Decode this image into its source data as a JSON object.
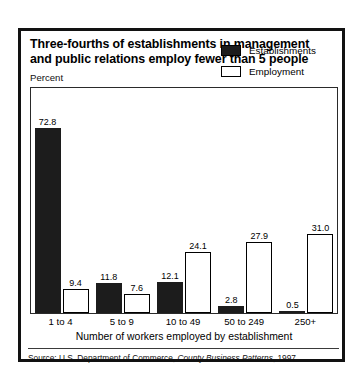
{
  "figure": {
    "title_line1": "Three-fourths of establishments in management",
    "title_line2": "and public relations employ fewer than 5 people",
    "percent_label": "Percent",
    "source_prefix": "Source: U.S. Department of Commerce, ",
    "source_italic": "County Business Patterns",
    "source_suffix": ", 1997"
  },
  "legend": {
    "items": [
      {
        "label": "Establishments",
        "swatch": "filled",
        "color": "#1c1c1c"
      },
      {
        "label": "Employment",
        "swatch": "open",
        "color": "#ffffff"
      }
    ]
  },
  "chart_data": {
    "type": "bar",
    "title": "Three-fourths of establishments in management and public relations employ fewer than 5 people",
    "xlabel": "Number of workers employed by establishment",
    "ylabel": "Percent",
    "ylim": [
      0,
      80
    ],
    "grid": false,
    "legend_position": "top-right",
    "categories": [
      "1 to 4",
      "5 to 9",
      "10 to 49",
      "50 to 249",
      "250+"
    ],
    "series": [
      {
        "name": "Establishments",
        "values": [
          72.8,
          11.8,
          12.1,
          2.8,
          0.5
        ]
      },
      {
        "name": "Employment",
        "values": [
          9.4,
          7.6,
          24.1,
          27.9,
          31.0
        ]
      }
    ],
    "value_labels": {
      "Establishments": [
        "72.8",
        "11.8",
        "12.1",
        "2.8",
        "0.5"
      ],
      "Employment": [
        "9.4",
        "7.6",
        "24.1",
        "27.9",
        "31.0"
      ]
    }
  }
}
